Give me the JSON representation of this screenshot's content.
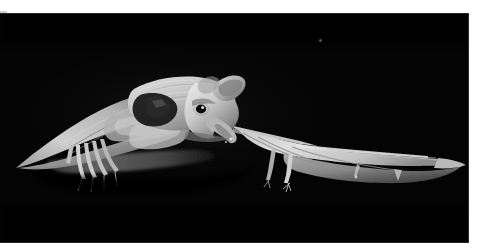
{
  "canvas": {
    "width": 482,
    "height": 252,
    "background_color": "#ffffff",
    "margin_note": "thin white margin on top, right and bottom of the photographic plate"
  },
  "photo": {
    "alt_text": "Black and white flash photograph of two bats in flight against a completely black background",
    "frame": {
      "left": 0,
      "top": 13,
      "width": 469,
      "height": 230
    },
    "background_color": "#040404",
    "highlight_color": "#f2f2f2",
    "midtone_color": "#9a9a9a",
    "shadow_color": "#1c1c1c",
    "medium": "monochrome flash photograph",
    "lighting": "single hard flash from the front, subjects lit against pure black",
    "subjects": [
      {
        "id": "bat-foreground",
        "label": "Foreground bat facing right",
        "description": "Pale furry bat body with head turned toward the camera, one large ear raised, dark glinting eye, long pointed snout with open mouth, near wing swept down and to the left with visible elongated finger bones and claws",
        "position": "left of centre, occupying roughly x 15-250",
        "features": [
          "furry back",
          "raised ear",
          "dark eye highlight",
          "pointed snout",
          "visible wing finger bones",
          "thumb claws"
        ]
      },
      {
        "id": "bat-background",
        "label": "Second bat with wings outstretched",
        "description": "Translucent thin membrane wing stretched fully to the right, lit from the front so the wing bones show as darker struts through the pale membrane, small legs and feet dangling below",
        "position": "right of centre, occupying roughly x 245-466",
        "features": [
          "outstretched membrane wing",
          "wing bone struts",
          "dangling hind legs",
          "tapering wing tip"
        ]
      }
    ],
    "details": [
      {
        "name": "light-speck",
        "description": "tiny faint dust or out-of-focus highlight in the upper right of the black field",
        "position": {
          "x": 319,
          "y": 39
        }
      }
    ]
  }
}
